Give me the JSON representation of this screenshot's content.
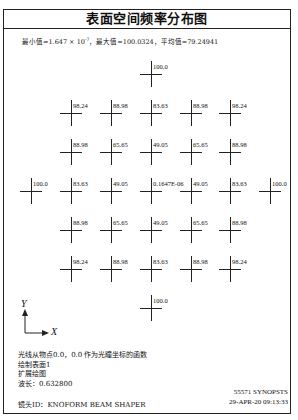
{
  "title": "表面空间频率分布图",
  "stats": {
    "prefix": "最小值=1.647 × 10",
    "exponent": "-7",
    "suffix": "，最大值=100.0324，平均值=79.24941"
  },
  "grid": {
    "rows": [
      {
        "y": 74,
        "cells": [
          {
            "x": 151,
            "label": "100.0"
          }
        ]
      },
      {
        "y": 113,
        "cells": [
          {
            "x": 71,
            "label": "98.24"
          },
          {
            "x": 111,
            "label": "88.98"
          },
          {
            "x": 151,
            "label": "83.63"
          },
          {
            "x": 191,
            "label": "88.98"
          },
          {
            "x": 230,
            "label": "98.24"
          }
        ]
      },
      {
        "y": 152,
        "cells": [
          {
            "x": 71,
            "label": "88.98"
          },
          {
            "x": 111,
            "label": "65.65"
          },
          {
            "x": 151,
            "label": "49.05"
          },
          {
            "x": 191,
            "label": "65.65"
          },
          {
            "x": 230,
            "label": "88.98"
          }
        ]
      },
      {
        "y": 191,
        "cells": [
          {
            "x": 31,
            "label": "100.0"
          },
          {
            "x": 71,
            "label": "83.63"
          },
          {
            "x": 111,
            "label": "49.05"
          },
          {
            "x": 151,
            "label": "0.1647E-06"
          },
          {
            "x": 191,
            "label": "49.05"
          },
          {
            "x": 230,
            "label": "83.63"
          },
          {
            "x": 270,
            "label": "100.0"
          }
        ]
      },
      {
        "y": 230,
        "cells": [
          {
            "x": 71,
            "label": "88.98"
          },
          {
            "x": 111,
            "label": "65.65"
          },
          {
            "x": 151,
            "label": "49.05"
          },
          {
            "x": 191,
            "label": "65.65"
          },
          {
            "x": 230,
            "label": "88.98"
          }
        ]
      },
      {
        "y": 269,
        "cells": [
          {
            "x": 71,
            "label": "98.24"
          },
          {
            "x": 111,
            "label": "88.98"
          },
          {
            "x": 151,
            "label": "83.63"
          },
          {
            "x": 191,
            "label": "88.98"
          },
          {
            "x": 230,
            "label": "98.24"
          }
        ]
      },
      {
        "y": 308,
        "cells": [
          {
            "x": 151,
            "label": "100.0"
          }
        ]
      }
    ]
  },
  "axis": {
    "y_label": "Y",
    "x_label": "X"
  },
  "notes": [
    "光线从物点0.0，0.0 作为光瞳坐标的函数",
    "绘制表面1",
    "扩展绘图",
    "波长：0.632800"
  ],
  "lens_id": "镜头ID：KNOFORM BEAM SHAPER",
  "stamp": {
    "line1": "55571   SYNOPSTS",
    "line2": "29-APR-20 09:13:33"
  }
}
